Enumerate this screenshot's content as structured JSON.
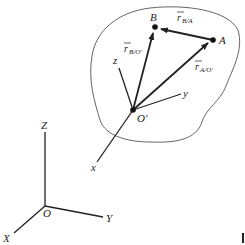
{
  "diagram": {
    "type": "relative-position-vectors",
    "fixed_frame": {
      "origin": "O",
      "axes": [
        "X",
        "Y",
        "Z"
      ]
    },
    "moving_frame": {
      "origin": "O'",
      "axes": [
        "x",
        "y",
        "z"
      ]
    },
    "points": {
      "A": "A",
      "B": "B",
      "O_prime": "O'"
    },
    "vectors": [
      {
        "id": "r_B_O",
        "symbol": "r",
        "subscript": "B/O'",
        "from": "O'",
        "to": "B"
      },
      {
        "id": "r_A_O",
        "symbol": "r",
        "subscript": "A/O'",
        "from": "O'",
        "to": "A"
      },
      {
        "id": "r_B_A",
        "symbol": "r",
        "subscript": "B/A",
        "from": "A",
        "to": "B"
      }
    ],
    "labels": {
      "X": "X",
      "Y": "Y",
      "Z": "Z",
      "O": "O",
      "x": "x",
      "y": "y",
      "z": "z",
      "Oprime": "O'",
      "A": "A",
      "B": "B",
      "r": "r",
      "sub_BO": "B/O'",
      "sub_AO": "A/O'",
      "sub_BA": "B/A"
    },
    "colors": {
      "ink": "#222222",
      "outline": "#555555",
      "background": "#ffffff"
    }
  }
}
